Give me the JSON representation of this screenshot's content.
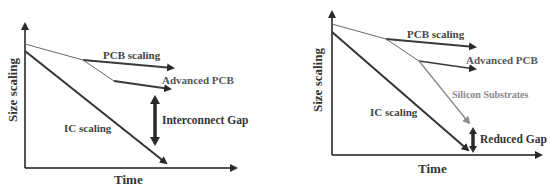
{
  "colors": {
    "axis": "#1a1a1a",
    "pcb": "#3a3a3a",
    "thin_line": "#6a6a6a",
    "ic": "#333333",
    "silicon": "#8c8c8c",
    "gap_arrow": "#2a2a2a",
    "text": "#333333",
    "silicon_text": "#8a8a8a"
  },
  "left_panel": {
    "y_label": "Size scaling",
    "x_label": "Time",
    "labels": {
      "pcb": "PCB scaling",
      "advanced_pcb": "Advanced PCB",
      "ic": "IC scaling",
      "gap": "Interconnect Gap"
    }
  },
  "right_panel": {
    "y_label": "Size scaling",
    "x_label": "Time",
    "labels": {
      "pcb": "PCB scaling",
      "advanced_pcb": "Advanced PCB",
      "silicon": "Silicon Substrates",
      "ic": "IC scaling",
      "gap": "Reduced Gap"
    }
  }
}
